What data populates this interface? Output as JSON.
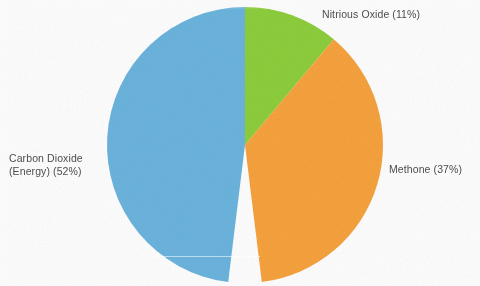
{
  "figure": {
    "background_color": "#fdfdfd",
    "text_color": "#4d4d4d"
  },
  "chart_data": {
    "type": "pie",
    "title": "",
    "subtitle": "",
    "xlabel": "",
    "ylabel": "",
    "legend_position": "none",
    "labels_position": "outside",
    "grid": false,
    "total_percent": 100,
    "categories": [
      "Carbon Dioxide (Energy)",
      "Nitrious Oxide",
      "Methone"
    ],
    "values": [
      52,
      11,
      37
    ],
    "colors": [
      "#6bb3dd",
      "#8ccd3c",
      "#f5a13d"
    ],
    "slices": [
      {
        "name": "Carbon Dioxide (Energy)",
        "value": 52,
        "percent_text": "(52%)",
        "color": "#6bb3dd",
        "label_line1": "Carbon Dioxide",
        "label_line2": "(Energy) (52%)",
        "label_text": "Carbon Dioxide\n(Energy) (52%)",
        "start_angle_deg": 187,
        "end_angle_deg": 360
      },
      {
        "name": "Nitrious Oxide",
        "value": 11,
        "percent_text": "(11%)",
        "color": "#8ccd3c",
        "label_text": "Nitrious Oxide (11%)",
        "start_angle_deg": 0,
        "end_angle_deg": 40
      },
      {
        "name": "Methone",
        "value": 37,
        "percent_text": "(37%)",
        "color": "#f5a13d",
        "label_text": "Methone (37%)",
        "start_angle_deg": 40,
        "end_angle_deg": 173
      }
    ]
  },
  "geometry": {
    "center_x": 245,
    "center_y": 145,
    "radius": 138
  }
}
